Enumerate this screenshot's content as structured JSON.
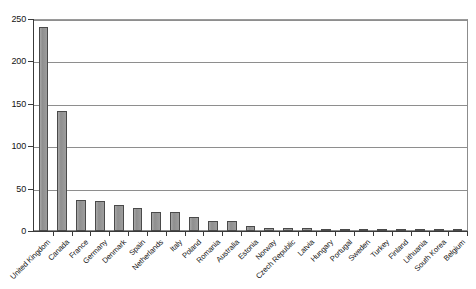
{
  "chart_data": {
    "type": "bar",
    "title": "",
    "subtitle": "",
    "xlabel": "",
    "ylabel": "",
    "ylim": [
      0,
      250
    ],
    "ytick_values": [
      0,
      50,
      100,
      150,
      200,
      250
    ],
    "ytick_labels": [
      "0",
      "50",
      "100",
      "150",
      "200",
      "250"
    ],
    "grid": "horizontal",
    "legend": "none",
    "bar_color": "#969696",
    "bar_edge_color": "#4a4a4a",
    "axis_color": "#3a3a3a",
    "gridline_color": "#8e8e8e",
    "background": "#ffffff",
    "categories": [
      "United Kingdom",
      "Canada",
      "France",
      "Germany",
      "Denmark",
      "Spain",
      "Netherlands",
      "Italy",
      "Poland",
      "Romania",
      "Australia",
      "Estonia",
      "Norway",
      "Czech Republic",
      "Latvia",
      "Hungary",
      "Portugal",
      "Sweden",
      "Turkey",
      "Finland",
      "Lithuania",
      "South Korea",
      "Belgium"
    ],
    "values": [
      240,
      141,
      37,
      35,
      31,
      27,
      23,
      22,
      16,
      12,
      12,
      6,
      4,
      3,
      3,
      2,
      2,
      2,
      2,
      1,
      1,
      1,
      1
    ]
  }
}
